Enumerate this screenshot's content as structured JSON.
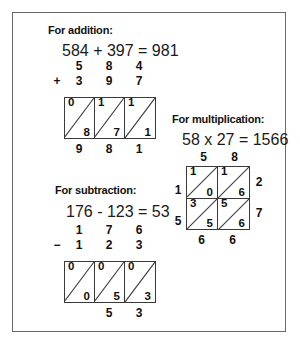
{
  "page": {
    "background_color": "#ffffff",
    "frame_color": "#6b6b6b",
    "ink_color": "#111111",
    "grid_line_color": "#3a3a3a"
  },
  "addition": {
    "heading": "For addition:",
    "equation": "584 + 397 = 981",
    "operator": "+",
    "addend_top": [
      "5",
      "8",
      "4"
    ],
    "addend_bottom": [
      "3",
      "9",
      "7"
    ],
    "lattice": {
      "columns": 3,
      "rows": 1,
      "cells": [
        [
          {
            "upper": "0",
            "lower": "8"
          },
          {
            "upper": "1",
            "lower": "7"
          },
          {
            "upper": "1",
            "lower": "1"
          }
        ]
      ]
    },
    "result_row": [
      "9",
      "8",
      "1"
    ],
    "result": "981"
  },
  "subtraction": {
    "heading": "For subtraction:",
    "equation": "176 - 123 = 53",
    "operator": "−",
    "minuend": [
      "1",
      "7",
      "6"
    ],
    "subtrahend": [
      "1",
      "2",
      "3"
    ],
    "lattice": {
      "columns": 3,
      "rows": 1,
      "cells": [
        [
          {
            "upper": "0",
            "lower": "0"
          },
          {
            "upper": "0",
            "lower": "5"
          },
          {
            "upper": "0",
            "lower": "3"
          }
        ]
      ]
    },
    "result_row": [
      "",
      "5",
      "3"
    ],
    "result": "53"
  },
  "multiplication": {
    "heading": "For multiplication:",
    "equation": "58 x 27 = 1566",
    "top_labels": [
      "5",
      "8"
    ],
    "right_labels": [
      "2",
      "7"
    ],
    "left_labels": [
      "1",
      "5"
    ],
    "lattice": {
      "columns": 2,
      "rows": 2,
      "cells": [
        [
          {
            "upper": "1",
            "lower": "0"
          },
          {
            "upper": "1",
            "lower": "6"
          }
        ],
        [
          {
            "upper": "3",
            "lower": "5"
          },
          {
            "upper": "5",
            "lower": "6"
          }
        ]
      ]
    },
    "bottom_labels": [
      "6",
      "6"
    ],
    "result": "1566"
  }
}
